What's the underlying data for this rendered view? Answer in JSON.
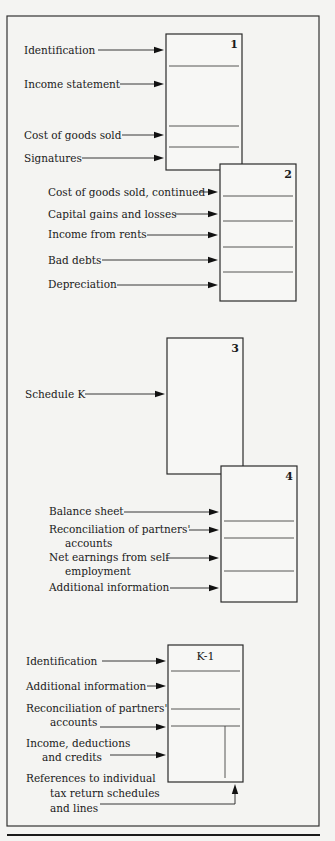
{
  "frame": {
    "x": 7,
    "y": 16,
    "w": 312,
    "h": 810,
    "rule_y": 835
  },
  "boxes": [
    {
      "id": "page-1",
      "label": "1",
      "x": 166,
      "y": 34,
      "w": 76,
      "h": 136,
      "label_align": "right",
      "dividers": [
        66,
        126,
        147
      ],
      "inner_vline": null
    },
    {
      "id": "page-2",
      "label": "2",
      "x": 220,
      "y": 164,
      "w": 76,
      "h": 137,
      "label_align": "right",
      "dividers": [
        196,
        221,
        247,
        272
      ],
      "inner_vline": null
    },
    {
      "id": "page-3",
      "label": "3",
      "x": 167,
      "y": 338,
      "w": 76,
      "h": 136,
      "label_align": "right",
      "dividers": [],
      "inner_vline": null
    },
    {
      "id": "page-4",
      "label": "4",
      "x": 221,
      "y": 466,
      "w": 76,
      "h": 136,
      "label_align": "right",
      "dividers": [
        521,
        538,
        571
      ],
      "inner_vline": null
    },
    {
      "id": "schedule-k1",
      "label": "K-1",
      "x": 168,
      "y": 645,
      "w": 75,
      "h": 137,
      "label_align": "center",
      "dividers": [
        671,
        709,
        726
      ],
      "inner_vline": {
        "x": 225,
        "y1": 726,
        "y2": 778
      }
    }
  ],
  "annotations": [
    {
      "lines": [
        "Identification"
      ],
      "x": 24,
      "y": 54,
      "arrow_from": 98,
      "arrow_to": 164,
      "arrow_y": 50
    },
    {
      "lines": [
        "Income statement"
      ],
      "x": 24,
      "y": 88,
      "arrow_from": 120,
      "arrow_to": 164,
      "arrow_y": 84
    },
    {
      "lines": [
        "Cost of goods sold"
      ],
      "x": 24,
      "y": 139,
      "arrow_from": 122,
      "arrow_to": 164,
      "arrow_y": 135
    },
    {
      "lines": [
        "Signatures"
      ],
      "x": 24,
      "y": 162,
      "arrow_from": 82,
      "arrow_to": 164,
      "arrow_y": 158
    },
    {
      "lines": [
        "Cost of goods sold, continued"
      ],
      "x": 48,
      "y": 196,
      "arrow_from": 199,
      "arrow_to": 218,
      "arrow_y": 192
    },
    {
      "lines": [
        "Capital gains and losses"
      ],
      "x": 48,
      "y": 218,
      "arrow_from": 175,
      "arrow_to": 218,
      "arrow_y": 214
    },
    {
      "lines": [
        "Income from rents"
      ],
      "x": 48,
      "y": 238,
      "arrow_from": 147,
      "arrow_to": 218,
      "arrow_y": 235
    },
    {
      "lines": [
        "Bad debts"
      ],
      "x": 48,
      "y": 264,
      "arrow_from": 102,
      "arrow_to": 218,
      "arrow_y": 260
    },
    {
      "lines": [
        "Depreciation"
      ],
      "x": 48,
      "y": 288,
      "arrow_from": 117,
      "arrow_to": 218,
      "arrow_y": 285
    },
    {
      "lines": [
        "Schedule K"
      ],
      "x": 25,
      "y": 398,
      "arrow_from": 85,
      "arrow_to": 165,
      "arrow_y": 394
    },
    {
      "lines": [
        "Balance sheet"
      ],
      "x": 49,
      "y": 515,
      "arrow_from": 124,
      "arrow_to": 219,
      "arrow_y": 512
    },
    {
      "lines": [
        "Reconciliation of partners'",
        "accounts"
      ],
      "x": 49,
      "y": 533,
      "indent": 16,
      "arrow_from": 189,
      "arrow_to": 219,
      "arrow_y": 530
    },
    {
      "lines": [
        "Net earnings from self",
        "employment"
      ],
      "x": 49,
      "y": 561,
      "indent": 16,
      "arrow_from": 166,
      "arrow_to": 219,
      "arrow_y": 558
    },
    {
      "lines": [
        "Additional information"
      ],
      "x": 49,
      "y": 591,
      "arrow_from": 170,
      "arrow_to": 219,
      "arrow_y": 588
    },
    {
      "lines": [
        "Identification"
      ],
      "x": 26,
      "y": 665,
      "arrow_from": 102,
      "arrow_to": 166,
      "arrow_y": 661
    },
    {
      "lines": [
        "Additional information"
      ],
      "x": 26,
      "y": 690,
      "arrow_from": 147,
      "arrow_to": 166,
      "arrow_y": 686
    },
    {
      "lines": [
        "Reconciliation of partners'",
        "accounts"
      ],
      "x": 26,
      "y": 712,
      "indent": 24,
      "arrow_from": 100,
      "arrow_to": 166,
      "arrow_y": 727
    },
    {
      "lines": [
        "Income, deductions",
        "and credits"
      ],
      "x": 26,
      "y": 747,
      "indent": 16,
      "arrow_from": 110,
      "arrow_to": 166,
      "arrow_y": 755
    },
    {
      "lines": [
        "References to individual",
        "tax return schedules",
        "and lines"
      ],
      "x": 26,
      "y": 782,
      "indents": [
        0,
        24,
        24
      ],
      "line_height": 15
    }
  ],
  "references_arrow": {
    "x_from": 100,
    "y": 804,
    "x_to": 235,
    "y_to": 784
  }
}
